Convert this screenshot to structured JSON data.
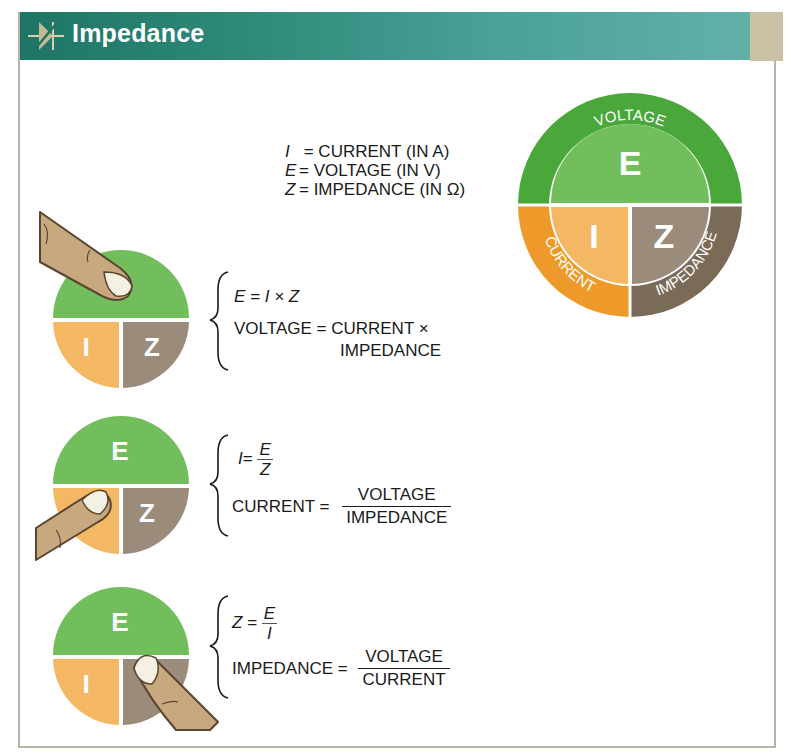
{
  "header": {
    "title": "Impedance",
    "icon": "varistor-symbol-icon"
  },
  "colors": {
    "header_dark": "#1e7566",
    "header_light": "#62b1a9",
    "header_tail": "#cbc2a6",
    "voltage_outer": "#4aa83a",
    "voltage_inner": "#72be5c",
    "current_outer": "#ee9a2a",
    "current_inner": "#f4b865",
    "impedance_outer": "#7a6a58",
    "impedance_inner": "#9a8b7a",
    "finger": "#c8a87e"
  },
  "legend": {
    "rows": [
      {
        "symbol": "I",
        "text": " = CURRENT (IN A)"
      },
      {
        "symbol": "E",
        "text": "= VOLTAGE (IN V)"
      },
      {
        "symbol": "Z",
        "text": "= IMPEDANCE (IN Ω)"
      }
    ]
  },
  "wheel": {
    "letters": {
      "E": "E",
      "I": "I",
      "Z": "Z"
    },
    "ring_labels": {
      "voltage": "VOLTAGE",
      "current": "CURRENT",
      "impedance": "IMPEDANCE"
    }
  },
  "formulas": [
    {
      "covered": "E",
      "symbolic": {
        "lhs": "E",
        "rhs": "= I × Z"
      },
      "words": {
        "lhs": "VOLTAGE = CURRENT ×",
        "rhs_line2": "IMPEDANCE"
      }
    },
    {
      "covered": "I",
      "symbolic": {
        "lhs": "I",
        "eq": "=",
        "num": "E",
        "den": "Z"
      },
      "words": {
        "lhs": "CURRENT =",
        "num": "VOLTAGE",
        "den": "IMPEDANCE"
      }
    },
    {
      "covered": "Z",
      "symbolic": {
        "lhs": "Z",
        "eq": "=",
        "num": "E",
        "den": "I"
      },
      "words": {
        "lhs": "IMPEDANCE =",
        "num": "VOLTAGE",
        "den": "CURRENT"
      }
    }
  ]
}
